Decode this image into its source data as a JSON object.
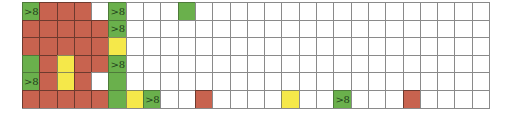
{
  "grid": {
    "columns": 27,
    "rows": 6,
    "legend_colors": {
      "r": "#c8634f",
      "g": "#6ab04c",
      "y": "#f5e84a",
      "w": "#ffffff"
    },
    "cells": [
      [
        [
          "g",
          ">8"
        ],
        [
          "r",
          ""
        ],
        [
          "r",
          ""
        ],
        [
          "r",
          ""
        ],
        [
          "w",
          ""
        ],
        [
          "g",
          ">8"
        ],
        [
          "w",
          ""
        ],
        [
          "w",
          ""
        ],
        [
          "w",
          ""
        ],
        [
          "g",
          ""
        ],
        [
          "w",
          ""
        ],
        [
          "w",
          ""
        ],
        [
          "w",
          ""
        ],
        [
          "w",
          ""
        ],
        [
          "w",
          ""
        ],
        [
          "w",
          ""
        ],
        [
          "w",
          ""
        ],
        [
          "w",
          ""
        ],
        [
          "w",
          ""
        ],
        [
          "w",
          ""
        ],
        [
          "w",
          ""
        ],
        [
          "w",
          ""
        ],
        [
          "w",
          ""
        ],
        [
          "w",
          ""
        ],
        [
          "w",
          ""
        ],
        [
          "w",
          ""
        ],
        [
          "w",
          ""
        ]
      ],
      [
        [
          "r",
          ""
        ],
        [
          "r",
          ""
        ],
        [
          "r",
          ""
        ],
        [
          "r",
          ""
        ],
        [
          "r",
          ""
        ],
        [
          "g",
          ">8"
        ],
        [
          "w",
          ""
        ],
        [
          "w",
          ""
        ],
        [
          "w",
          ""
        ],
        [
          "w",
          ""
        ],
        [
          "w",
          ""
        ],
        [
          "w",
          ""
        ],
        [
          "w",
          ""
        ],
        [
          "w",
          ""
        ],
        [
          "w",
          ""
        ],
        [
          "w",
          ""
        ],
        [
          "w",
          ""
        ],
        [
          "w",
          ""
        ],
        [
          "w",
          ""
        ],
        [
          "w",
          ""
        ],
        [
          "w",
          ""
        ],
        [
          "w",
          ""
        ],
        [
          "w",
          ""
        ],
        [
          "w",
          ""
        ],
        [
          "w",
          ""
        ],
        [
          "w",
          ""
        ],
        [
          "w",
          ""
        ]
      ],
      [
        [
          "r",
          ""
        ],
        [
          "r",
          ""
        ],
        [
          "r",
          ""
        ],
        [
          "r",
          ""
        ],
        [
          "r",
          ""
        ],
        [
          "y",
          ""
        ],
        [
          "w",
          ""
        ],
        [
          "w",
          ""
        ],
        [
          "w",
          ""
        ],
        [
          "w",
          ""
        ],
        [
          "w",
          ""
        ],
        [
          "w",
          ""
        ],
        [
          "w",
          ""
        ],
        [
          "w",
          ""
        ],
        [
          "w",
          ""
        ],
        [
          "w",
          ""
        ],
        [
          "w",
          ""
        ],
        [
          "w",
          ""
        ],
        [
          "w",
          ""
        ],
        [
          "w",
          ""
        ],
        [
          "w",
          ""
        ],
        [
          "w",
          ""
        ],
        [
          "w",
          ""
        ],
        [
          "w",
          ""
        ],
        [
          "w",
          ""
        ],
        [
          "w",
          ""
        ],
        [
          "w",
          ""
        ]
      ],
      [
        [
          "g",
          ""
        ],
        [
          "r",
          ""
        ],
        [
          "y",
          ""
        ],
        [
          "r",
          ""
        ],
        [
          "r",
          ""
        ],
        [
          "g",
          ">8"
        ],
        [
          "w",
          ""
        ],
        [
          "w",
          ""
        ],
        [
          "w",
          ""
        ],
        [
          "w",
          ""
        ],
        [
          "w",
          ""
        ],
        [
          "w",
          ""
        ],
        [
          "w",
          ""
        ],
        [
          "w",
          ""
        ],
        [
          "w",
          ""
        ],
        [
          "w",
          ""
        ],
        [
          "w",
          ""
        ],
        [
          "w",
          ""
        ],
        [
          "w",
          ""
        ],
        [
          "w",
          ""
        ],
        [
          "w",
          ""
        ],
        [
          "w",
          ""
        ],
        [
          "w",
          ""
        ],
        [
          "w",
          ""
        ],
        [
          "w",
          ""
        ],
        [
          "w",
          ""
        ],
        [
          "w",
          ""
        ]
      ],
      [
        [
          "g",
          ">8"
        ],
        [
          "r",
          ""
        ],
        [
          "y",
          ""
        ],
        [
          "r",
          ""
        ],
        [
          "w",
          ""
        ],
        [
          "g",
          ""
        ],
        [
          "w",
          ""
        ],
        [
          "w",
          ""
        ],
        [
          "w",
          ""
        ],
        [
          "w",
          ""
        ],
        [
          "w",
          ""
        ],
        [
          "w",
          ""
        ],
        [
          "w",
          ""
        ],
        [
          "w",
          ""
        ],
        [
          "w",
          ""
        ],
        [
          "w",
          ""
        ],
        [
          "w",
          ""
        ],
        [
          "w",
          ""
        ],
        [
          "w",
          ""
        ],
        [
          "w",
          ""
        ],
        [
          "w",
          ""
        ],
        [
          "w",
          ""
        ],
        [
          "w",
          ""
        ],
        [
          "w",
          ""
        ],
        [
          "w",
          ""
        ],
        [
          "w",
          ""
        ],
        [
          "w",
          ""
        ]
      ],
      [
        [
          "r",
          ""
        ],
        [
          "r",
          ""
        ],
        [
          "r",
          ""
        ],
        [
          "r",
          ""
        ],
        [
          "r",
          ""
        ],
        [
          "g",
          ""
        ],
        [
          "y",
          ""
        ],
        [
          "g",
          ">8"
        ],
        [
          "w",
          ""
        ],
        [
          "w",
          ""
        ],
        [
          "r",
          ""
        ],
        [
          "w",
          ""
        ],
        [
          "w",
          ""
        ],
        [
          "w",
          ""
        ],
        [
          "w",
          ""
        ],
        [
          "y",
          ""
        ],
        [
          "w",
          ""
        ],
        [
          "w",
          ""
        ],
        [
          "g",
          ">8"
        ],
        [
          "w",
          ""
        ],
        [
          "w",
          ""
        ],
        [
          "w",
          ""
        ],
        [
          "r",
          ""
        ],
        [
          "w",
          ""
        ],
        [
          "w",
          ""
        ],
        [
          "w",
          ""
        ],
        [
          "w",
          ""
        ]
      ]
    ]
  }
}
